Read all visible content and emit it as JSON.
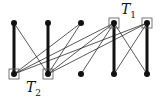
{
  "diagram": {
    "type": "bipartite-graph",
    "top_nodes": [
      {
        "id": "a1",
        "x": 14,
        "y": 23,
        "boxed": false
      },
      {
        "id": "a2",
        "x": 48,
        "y": 23,
        "boxed": false
      },
      {
        "id": "a3",
        "x": 81,
        "y": 23,
        "boxed": false
      },
      {
        "id": "a4",
        "x": 114,
        "y": 23,
        "boxed": true
      },
      {
        "id": "a5",
        "x": 147,
        "y": 23,
        "boxed": true
      }
    ],
    "bottom_nodes": [
      {
        "id": "b1",
        "x": 14,
        "y": 74,
        "boxed": true
      },
      {
        "id": "b2",
        "x": 48,
        "y": 74,
        "boxed": true
      },
      {
        "id": "b3",
        "x": 81,
        "y": 74,
        "boxed": false
      },
      {
        "id": "b4",
        "x": 114,
        "y": 74,
        "boxed": false
      },
      {
        "id": "b5",
        "x": 147,
        "y": 74,
        "boxed": false
      }
    ],
    "thick_edges": [
      [
        "a1",
        "b1"
      ],
      [
        "a2",
        "b2"
      ],
      [
        "a4",
        "b4"
      ],
      [
        "a5",
        "b5"
      ]
    ],
    "thin_edges": [
      [
        "a1",
        "b2"
      ],
      [
        "a3",
        "b1"
      ],
      [
        "a3",
        "b2"
      ],
      [
        "a4",
        "b1"
      ],
      [
        "a4",
        "b2"
      ],
      [
        "a4",
        "b3"
      ],
      [
        "a4",
        "b5"
      ],
      [
        "a5",
        "b1"
      ],
      [
        "a5",
        "b2"
      ],
      [
        "a5",
        "b4"
      ]
    ],
    "labels": {
      "t1": {
        "base": "T",
        "sub": "1"
      },
      "t2": {
        "base": "T",
        "sub": "2"
      }
    }
  }
}
